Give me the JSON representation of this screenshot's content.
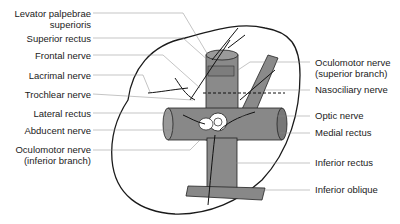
{
  "diagram": {
    "title": "",
    "left_labels": [
      {
        "id": "levator",
        "lines": [
          "Levator palpebrae",
          "superioris"
        ]
      },
      {
        "id": "superior-rectus",
        "lines": [
          "Superior rectus"
        ]
      },
      {
        "id": "frontal-nerve",
        "lines": [
          "Frontal nerve"
        ]
      },
      {
        "id": "lacrimal-nerve",
        "lines": [
          "Lacrimal nerve"
        ]
      },
      {
        "id": "trochlear-nerve",
        "lines": [
          "Trochlear nerve"
        ]
      },
      {
        "id": "lateral-rectus",
        "lines": [
          "Lateral rectus"
        ]
      },
      {
        "id": "abducent-nerve",
        "lines": [
          "Abducent nerve"
        ]
      },
      {
        "id": "oculomotor-inferior",
        "lines": [
          "Oculomotor nerve",
          "(inferior branch)"
        ]
      }
    ],
    "right_labels": [
      {
        "id": "oculomotor-superior",
        "lines": [
          "Oculomotor nerve",
          "(superior branch)"
        ]
      },
      {
        "id": "nasociliary-nerve",
        "lines": [
          "Nasociliary nerve"
        ]
      },
      {
        "id": "optic-nerve",
        "lines": [
          "Optic nerve"
        ]
      },
      {
        "id": "medial-rectus",
        "lines": [
          "Medial rectus"
        ]
      },
      {
        "id": "inferior-rectus",
        "lines": [
          "Inferior rectus"
        ]
      },
      {
        "id": "inferior-oblique",
        "lines": [
          "Inferior oblique"
        ]
      }
    ],
    "colors": {
      "muscle": "#8a8a8a",
      "outline": "#1a1a1a",
      "leader": "#888888"
    }
  }
}
